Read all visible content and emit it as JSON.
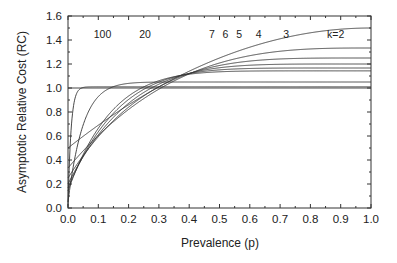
{
  "chart_data": {
    "type": "line",
    "title": "",
    "xlabel": "Prevalence (p)",
    "ylabel": "Asymptotic Relative Cost (RC)",
    "xlim": [
      0.0,
      1.0
    ],
    "ylim": [
      0.0,
      1.6
    ],
    "x_ticks": [
      "0.0",
      "0.1",
      "0.2",
      "0.3",
      "0.4",
      "0.5",
      "0.6",
      "0.7",
      "0.8",
      "0.9",
      "1.0"
    ],
    "y_ticks": [
      "0.0",
      "0.2",
      "0.4",
      "0.6",
      "0.8",
      "1.0",
      "1.2",
      "1.4",
      "1.6"
    ],
    "grid": false,
    "legend": "none (inline curve labels)",
    "reference_line": {
      "y": 1.0,
      "style": "horizontal"
    },
    "formula_hint": "RC = 1/k + 1 - (1-p)^k",
    "series": [
      {
        "name": "100",
        "k": 100,
        "label_pos": [
          0.085,
          1.45
        ],
        "points": [
          [
            0,
            0.01
          ],
          [
            0.01,
            0.644
          ],
          [
            0.02,
            0.877
          ],
          [
            0.03,
            0.962
          ],
          [
            0.04,
            0.993
          ],
          [
            0.06,
            1.008
          ]
        ]
      },
      {
        "name": "20",
        "k": 20,
        "label_pos": [
          0.235,
          1.45
        ],
        "points": [
          [
            0,
            0.05
          ],
          [
            0.05,
            0.408
          ],
          [
            0.1,
            0.728
          ],
          [
            0.15,
            0.911
          ],
          [
            0.2,
            1.038
          ],
          [
            0.25,
            1.047
          ]
        ]
      },
      {
        "name": "7",
        "k": 7,
        "label_pos": [
          0.465,
          1.45
        ],
        "points": [
          [
            0,
            0.143
          ],
          [
            0.1,
            0.665
          ],
          [
            0.2,
            0.933
          ],
          [
            0.3,
            1.061
          ],
          [
            0.4,
            1.115
          ],
          [
            0.5,
            1.135
          ]
        ]
      },
      {
        "name": "6",
        "k": 6,
        "label_pos": [
          0.51,
          1.45
        ],
        "points": [
          [
            0,
            0.167
          ],
          [
            0.1,
            0.635
          ],
          [
            0.2,
            0.905
          ],
          [
            0.3,
            1.049
          ],
          [
            0.4,
            1.12
          ],
          [
            0.5,
            1.151
          ]
        ]
      },
      {
        "name": "5",
        "k": 5,
        "label_pos": [
          0.555,
          1.45
        ],
        "points": [
          [
            0,
            0.2
          ],
          [
            0.1,
            0.61
          ],
          [
            0.2,
            0.872
          ],
          [
            0.3,
            1.032
          ],
          [
            0.4,
            1.122
          ],
          [
            0.5,
            1.169
          ]
        ]
      },
      {
        "name": "4",
        "k": 4,
        "label_pos": [
          0.62,
          1.45
        ],
        "points": [
          [
            0,
            0.25
          ],
          [
            0.1,
            0.594
          ],
          [
            0.2,
            0.84
          ],
          [
            0.3,
            1.01
          ],
          [
            0.4,
            1.12
          ],
          [
            0.5,
            1.188
          ]
        ]
      },
      {
        "name": "3",
        "k": 3,
        "label_pos": [
          0.71,
          1.45
        ],
        "points": [
          [
            0,
            0.333
          ],
          [
            0.1,
            0.604
          ],
          [
            0.2,
            0.821
          ],
          [
            0.3,
            0.99
          ],
          [
            0.4,
            1.117
          ],
          [
            0.5,
            1.208
          ]
        ]
      },
      {
        "name": "k=2",
        "k": 2,
        "label_pos": [
          0.855,
          1.45
        ],
        "points": [
          [
            0,
            0.5
          ],
          [
            0.1,
            0.69
          ],
          [
            0.2,
            0.86
          ],
          [
            0.3,
            1.01
          ],
          [
            0.4,
            1.14
          ],
          [
            0.5,
            1.25
          ],
          [
            0.6,
            1.34
          ],
          [
            0.7,
            1.41
          ],
          [
            0.8,
            1.46
          ]
        ]
      }
    ]
  }
}
